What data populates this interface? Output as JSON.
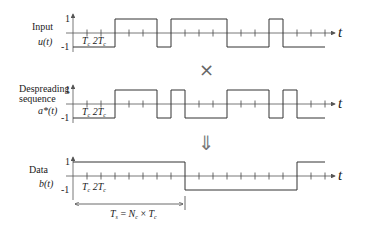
{
  "panels": [
    {
      "id": "input",
      "title_lines": [
        "Input"
      ],
      "signal_label": "u(t)",
      "y_top_label": "1",
      "y_bottom_label": "-1",
      "tick_labels": [
        "T_c",
        "2T_c"
      ],
      "tick_label_text": "Tc 2Tc",
      "time_label": "t",
      "chips": [
        -1,
        -1,
        -1,
        1,
        1,
        1,
        -1,
        1,
        1,
        1,
        1,
        -1,
        -1,
        -1,
        1,
        -1,
        -1,
        -1
      ]
    },
    {
      "id": "despreading",
      "title_lines": [
        "Despreading",
        "sequence"
      ],
      "signal_label": "a*(t)",
      "y_top_label": "1",
      "y_bottom_label": "-1",
      "tick_labels": [
        "T_c",
        "2T_c"
      ],
      "tick_label_text": "Tc 2Tc",
      "time_label": "t",
      "chips": [
        -1,
        -1,
        -1,
        1,
        1,
        1,
        -1,
        1,
        -1,
        -1,
        -1,
        1,
        1,
        1,
        -1,
        1,
        -1,
        -1
      ]
    },
    {
      "id": "data",
      "title_lines": [
        "Data"
      ],
      "signal_label": "b(t)",
      "y_top_label": "1",
      "y_bottom_label": "-1",
      "tick_labels": [
        "T_c",
        "2T_c"
      ],
      "tick_label_text": "Tc 2Tc",
      "time_label": "t",
      "chips": [
        1,
        1,
        1,
        1,
        1,
        1,
        1,
        1,
        -1,
        -1,
        -1,
        -1,
        -1,
        -1,
        -1,
        -1,
        1,
        1
      ]
    }
  ],
  "operators": {
    "multiply_symbol": "×",
    "result_arrow": "⇓"
  },
  "symbol_period": {
    "label": "Ts = Nc × Tc",
    "chips_per_symbol": 8
  },
  "chart_data": {
    "type": "line",
    "xlabel": "t",
    "ylabel": "",
    "ylim": [
      -1,
      1
    ],
    "x_unit": "T_c (chip period)",
    "x": [
      0,
      1,
      2,
      3,
      4,
      5,
      6,
      7,
      8,
      9,
      10,
      11,
      12,
      13,
      14,
      15,
      16,
      17
    ],
    "series": [
      {
        "name": "Input u(t)",
        "values": [
          -1,
          -1,
          -1,
          1,
          1,
          1,
          -1,
          1,
          1,
          1,
          1,
          -1,
          -1,
          -1,
          1,
          -1,
          -1,
          -1
        ]
      },
      {
        "name": "Despreading sequence a*(t)",
        "values": [
          -1,
          -1,
          -1,
          1,
          1,
          1,
          -1,
          1,
          -1,
          -1,
          -1,
          1,
          1,
          1,
          -1,
          1,
          -1,
          -1
        ]
      },
      {
        "name": "Data b(t)",
        "values": [
          1,
          1,
          1,
          1,
          1,
          1,
          1,
          1,
          -1,
          -1,
          -1,
          -1,
          -1,
          -1,
          -1,
          -1,
          1,
          1
        ]
      }
    ],
    "annotations": [
      "T_c",
      "2T_c",
      "T_s = N_c × T_c"
    ],
    "grid": false
  }
}
